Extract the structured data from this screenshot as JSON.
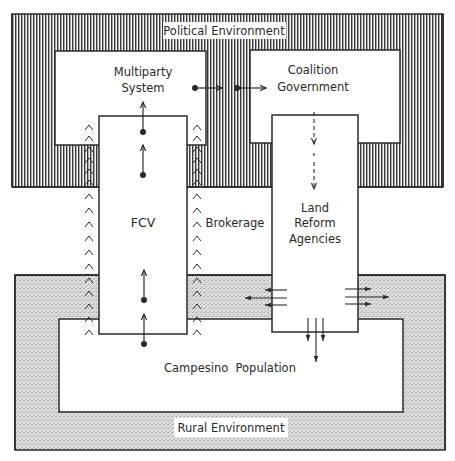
{
  "diagram": {
    "environments": {
      "political": {
        "label": "Political Environment",
        "pattern": "vertical-hatch"
      },
      "rural": {
        "label": "Rural Environment",
        "pattern": "stipple"
      }
    },
    "nodes": {
      "multiparty": {
        "line1": "Multiparty",
        "line2": "System"
      },
      "coalition": {
        "line1": "Coalition",
        "line2": "Government"
      },
      "fcv": {
        "label": "FCV"
      },
      "brokerage": {
        "label": "Brokerage"
      },
      "lra": {
        "line1": "Land",
        "line2": "Reform",
        "line3": "Agencies"
      },
      "campesino": {
        "label": "Campesino  Population"
      }
    },
    "edges": [
      {
        "from": "Multiparty System",
        "to": "Coalition Government",
        "style": "dotted-origin arrows"
      },
      {
        "from": "Coalition Government",
        "to": "Land Reform Agencies",
        "style": "dashed down arrows"
      },
      {
        "from": "Campesino Population",
        "to": "FCV",
        "style": "dotted-origin up arrows"
      },
      {
        "from": "FCV",
        "to": "Multiparty System",
        "style": "dotted-origin up arrows"
      },
      {
        "from": "Land Reform Agencies",
        "to": "Rural Environment",
        "style": "triple arrows left/right/down"
      }
    ],
    "chevron_glyph": "^",
    "colors": {
      "line": "#2a2a2a",
      "hatch": "#3a3a3a",
      "stipple": "#d6d6d6",
      "background": "#ffffff"
    }
  }
}
